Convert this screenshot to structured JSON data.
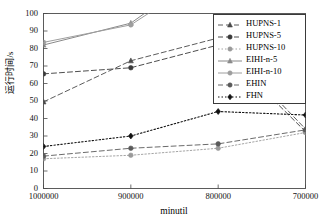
{
  "chart_data": {
    "type": "line",
    "title": "",
    "xlabel": "minutil",
    "ylabel": "运行时间/s",
    "x_categories": [
      "1000000",
      "900000",
      "800000",
      "700000"
    ],
    "xlim": [
      0,
      3
    ],
    "ylim": [
      0,
      100
    ],
    "ytick_labels": [
      "0",
      "10",
      "20",
      "30",
      "40",
      "50",
      "60",
      "70",
      "80",
      "90",
      "100"
    ],
    "ytick_values": [
      0,
      10,
      20,
      30,
      40,
      50,
      60,
      70,
      80,
      90,
      100
    ],
    "grid": false,
    "legend_position": "top-right",
    "series": [
      {
        "name": "HUPNS-1",
        "values": [
          49.5,
          73.0,
          86.0,
          34.0
        ],
        "color": "#4a4a4a",
        "dash": "5,3",
        "marker": "triangle",
        "width": 0.9
      },
      {
        "name": "HUPNS-5",
        "values": [
          65.5,
          69.0,
          82.0,
          32.5
        ],
        "color": "#3a3a3a",
        "dash": "5,3",
        "marker": "circle",
        "width": 0.9
      },
      {
        "name": "HUPNS-10",
        "values": [
          17.0,
          19.0,
          23.0,
          32.0
        ],
        "color": "#9a9a9a",
        "dash": "1.5,2",
        "marker": "circle",
        "width": 0.9
      },
      {
        "name": "EIHI-n-5",
        "values": [
          82.0,
          94.5,
          130.0,
          175.0
        ],
        "color": "#8a8a8a",
        "dash": "none",
        "marker": "triangle",
        "width": 1.0
      },
      {
        "name": "EIHI-n-10",
        "values": [
          83.5,
          93.5,
          126.0,
          168.0
        ],
        "color": "#9e9e9e",
        "dash": "none",
        "marker": "circle",
        "width": 1.0
      },
      {
        "name": "EHIN",
        "values": [
          18.5,
          23.0,
          25.5,
          33.5
        ],
        "color": "#5a5a5a",
        "dash": "5,3",
        "marker": "circle",
        "width": 0.9
      },
      {
        "name": "FHN",
        "values": [
          24.0,
          30.0,
          44.0,
          42.0
        ],
        "color": "#111111",
        "dash": "1.5,2",
        "marker": "diamond",
        "width": 1.1
      }
    ]
  },
  "legend": {
    "items": [
      {
        "label": "HUPNS-1"
      },
      {
        "label": "HUPNS-5"
      },
      {
        "label": "HUPNS-10"
      },
      {
        "label": "EIHI-n-5"
      },
      {
        "label": "EIHI-n-10"
      },
      {
        "label": "EHIN"
      },
      {
        "label": "FHN"
      }
    ]
  }
}
